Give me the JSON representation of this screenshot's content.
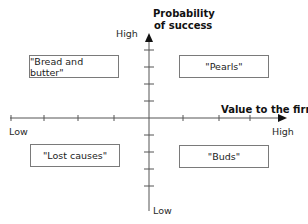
{
  "diagram": {
    "type": "quadrant-matrix",
    "y_axis": {
      "title_line1": "Probability",
      "title_line2": "of success",
      "high_label": "High",
      "low_label": "Low"
    },
    "x_axis": {
      "title": "Value to the firm",
      "high_label": "High",
      "low_label": "Low"
    },
    "quadrants": {
      "top_left": "\"Bread and butter\"",
      "top_right": "\"Pearls\"",
      "bottom_left": "\"Lost causes\"",
      "bottom_right": "\"Buds\""
    },
    "colors": {
      "axis": "#555555",
      "box_border": "#7a7a7a",
      "text": "#222222"
    }
  }
}
